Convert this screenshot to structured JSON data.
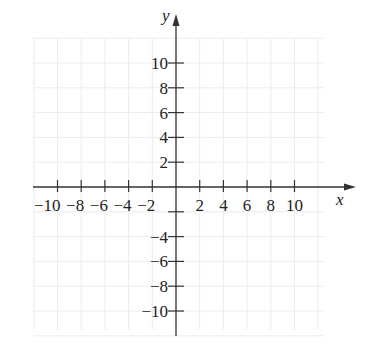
{
  "diagram": {
    "type": "coordinate-plane",
    "axes": {
      "x_label": "x",
      "y_label": "y",
      "x_range": [
        -12,
        12
      ],
      "y_range": [
        -12,
        12
      ]
    },
    "x_ticks": [
      {
        "value": -10,
        "label": "−10"
      },
      {
        "value": -8,
        "label": "−8"
      },
      {
        "value": -6,
        "label": "−6"
      },
      {
        "value": -4,
        "label": "−4"
      },
      {
        "value": -2,
        "label": "−2"
      },
      {
        "value": 2,
        "label": "2"
      },
      {
        "value": 4,
        "label": "4"
      },
      {
        "value": 6,
        "label": "6"
      },
      {
        "value": 8,
        "label": "8"
      },
      {
        "value": 10,
        "label": "10"
      }
    ],
    "y_ticks": [
      {
        "value": 10,
        "label": "10"
      },
      {
        "value": 8,
        "label": "8"
      },
      {
        "value": 6,
        "label": "6"
      },
      {
        "value": 4,
        "label": "4"
      },
      {
        "value": 2,
        "label": "2"
      },
      {
        "value": -2,
        "label": ""
      },
      {
        "value": -4,
        "label": "−4"
      },
      {
        "value": -6,
        "label": "−6"
      },
      {
        "value": -8,
        "label": "−8"
      },
      {
        "value": -10,
        "label": "−10"
      }
    ],
    "grid": true,
    "colors": {
      "axis": "#333333",
      "grid": "#ececec",
      "text": "#222222"
    }
  }
}
